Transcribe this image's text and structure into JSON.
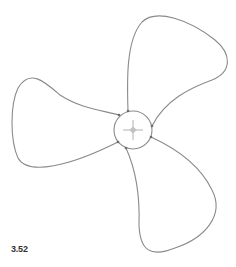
{
  "figure": {
    "label": "3.52",
    "colors": {
      "stroke": "#8a8a8a",
      "background": "#ffffff",
      "label": "#333333"
    },
    "hub": {
      "cx": 133,
      "cy": 130,
      "r": 19
    },
    "blades": [
      {
        "name": "top",
        "path": "M128 111 C127 80 126 40 142 22 C156 8 190 20 215 40 C232 54 232 72 212 80 C190 88 165 100 152 126"
      },
      {
        "name": "left",
        "path": "M119 115 C100 110 80 108 60 95 C45 82 30 68 18 88 C10 105 10 140 18 158 C28 176 70 166 118 142"
      },
      {
        "name": "bottom",
        "path": "M126 148 C136 170 140 195 139 225 C140 250 150 258 175 248 C205 238 225 215 212 190 C200 165 175 148 151 137"
      }
    ],
    "nodes": [
      {
        "x": 128,
        "y": 111
      },
      {
        "x": 152,
        "y": 126
      },
      {
        "x": 119,
        "y": 115
      },
      {
        "x": 118,
        "y": 142
      },
      {
        "x": 126,
        "y": 148
      },
      {
        "x": 151,
        "y": 137
      }
    ]
  }
}
